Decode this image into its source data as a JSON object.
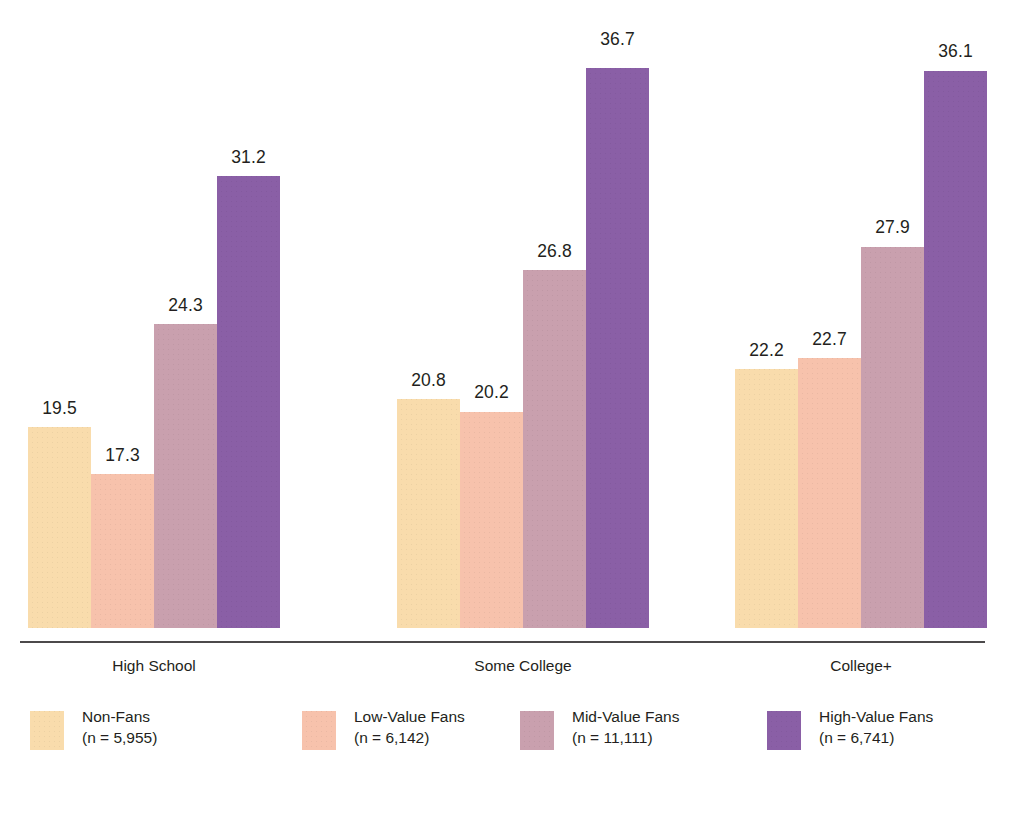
{
  "chart_data": {
    "type": "bar",
    "title": "",
    "subtitle": "",
    "xlabel": "",
    "ylabel": "",
    "ylim": [
      0,
      40
    ],
    "grid": false,
    "legend_position": "bottom",
    "categories": [
      "High School",
      "Some College",
      "College+"
    ],
    "series": [
      {
        "name": "Non-Fans",
        "n_label": "(n = 5,955)",
        "color": "#f9dcac",
        "values": [
          19.5,
          20.8,
          22.2
        ],
        "labels": [
          "19.5",
          "20.8",
          "22.2"
        ]
      },
      {
        "name": "Low-Value Fans",
        "n_label": "(n = 6,142)",
        "color": "#f7c2ac",
        "values": [
          17.3,
          20.2,
          22.7
        ],
        "labels": [
          "17.3",
          "20.2",
          "22.7"
        ]
      },
      {
        "name": "Mid-Value Fans",
        "n_label": "(n = 11,111)",
        "color": "#c9a0ae",
        "values": [
          24.3,
          26.8,
          27.9
        ],
        "labels": [
          "24.3",
          "26.8",
          "27.9"
        ]
      },
      {
        "name": "High-Value Fans",
        "n_label": "(n = 6,741)",
        "color": "#8a5fa6",
        "values": [
          31.2,
          36.7,
          36.1
        ],
        "labels": [
          "31.2",
          "36.7",
          "36.1"
        ]
      }
    ]
  },
  "axis": {
    "baseline_color": "#4c4a4b"
  },
  "groups": [
    {
      "label": "High School",
      "left": 28,
      "center": 154,
      "values": [
        "19.5",
        "17.3",
        "24.3",
        "31.2"
      ]
    },
    {
      "label": "Some College",
      "left": 397,
      "center": 523,
      "values": [
        "20.8",
        "20.2",
        "26.8",
        "36.7"
      ]
    },
    {
      "label": "College+",
      "left": 735,
      "center": 861,
      "values": [
        "22.2",
        "22.7",
        "27.9",
        "36.1"
      ]
    }
  ],
  "legend": [
    {
      "name": "Non-Fans",
      "n": "(n = 5,955)",
      "color": "#f9dcac",
      "left": 30
    },
    {
      "name": "Low-Value Fans",
      "n": "(n = 6,142)",
      "color": "#f7c2ac",
      "left": 302
    },
    {
      "name": "Mid-Value Fans",
      "n": "(n = 11,111)",
      "color": "#c9a0ae",
      "left": 520
    },
    {
      "name": "High-Value Fans",
      "n": "(n = 6,741)",
      "color": "#8a5fa6",
      "left": 767
    }
  ]
}
